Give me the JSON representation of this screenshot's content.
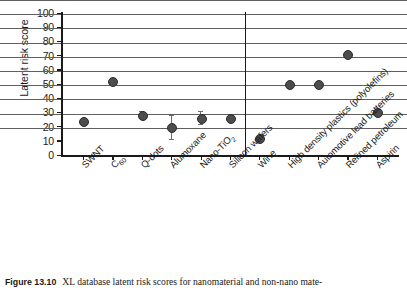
{
  "figure": {
    "number": "Figure 13.10",
    "caption": "XL database latent risk scores for nanomaterial and non-nano mate-"
  },
  "chart_data": {
    "type": "scatter",
    "title": "",
    "xlabel": "",
    "ylabel": "Latent risk score",
    "ylim": [
      0,
      100
    ],
    "ytick_step": 10,
    "ytick_labels": [
      "100",
      "90",
      "80",
      "70",
      "60",
      "50",
      "40",
      "30",
      "20",
      "10",
      "0"
    ],
    "grid": "horizontal",
    "legend": "none",
    "divider_after_category": "Silicon wafers",
    "divider_note": "separates nanomaterials (left) from non-nano materials (right)",
    "categories": [
      "SWNT",
      "C60",
      "Q-dots",
      "Alumoxane",
      "Nano-TiO2",
      "Silicon wafers",
      "Wine",
      "High density plastics (polyolefins)",
      "Automotive lead batteries",
      "Refined petroleum",
      "Aspirin"
    ],
    "category_labels": [
      "SWNT",
      "C<sub>60</sub>",
      "Q-dots",
      "Alumoxane",
      "Nano-TiO<sub>2</sub>",
      "Silicon wafers",
      "Wine",
      "High density plastics (polyolefins)",
      "Automotive lead batteries",
      "Refined petroleum",
      "Aspirin"
    ],
    "values": [
      24,
      52,
      28,
      20,
      26,
      26,
      12,
      50,
      50,
      71,
      30
    ],
    "error_low": [
      null,
      null,
      26,
      11,
      22,
      null,
      null,
      null,
      null,
      null,
      null
    ],
    "error_high": [
      null,
      null,
      31,
      28,
      31,
      null,
      null,
      null,
      null,
      null,
      null
    ],
    "marker_color": "#4d4d4d",
    "gridline_color": "#5f5f5f",
    "axis_color": "#1a1a1a"
  }
}
